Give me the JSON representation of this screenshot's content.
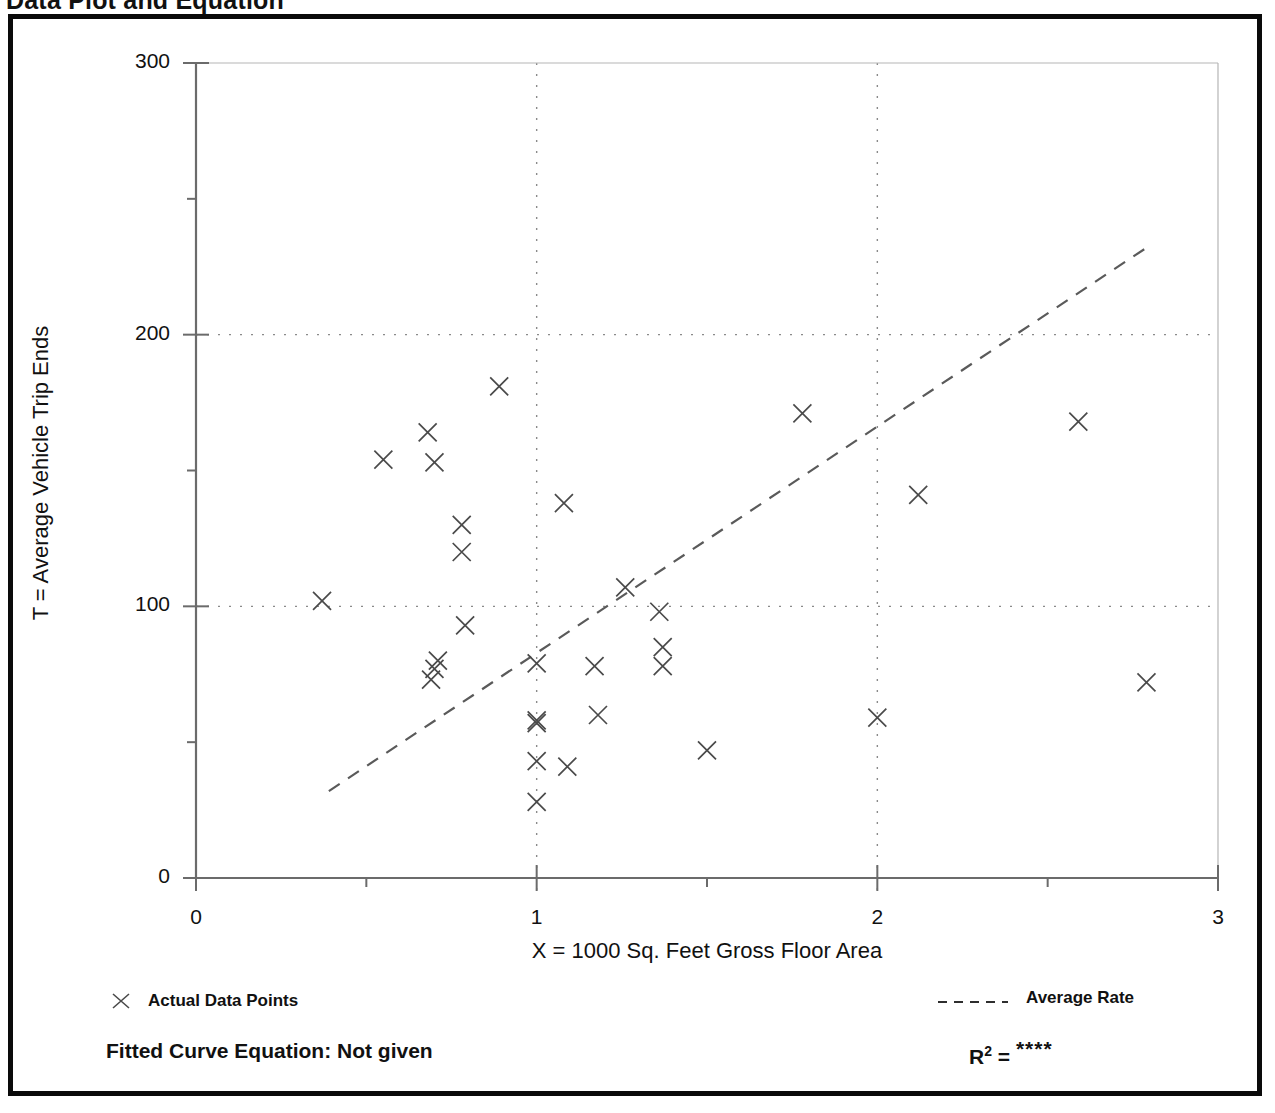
{
  "page": {
    "title": "Data Plot and Equation"
  },
  "legend": {
    "points_label": "Actual Data Points",
    "points_marker": "x-marker-icon",
    "rate_label": "Average Rate",
    "rate_marker": "dashed-line-icon"
  },
  "footer": {
    "equation_label": "Fitted Curve Equation:  Not given",
    "r2_base": "R",
    "r2_exponent": "2",
    "r2_equals": " = ",
    "r2_value": "****"
  },
  "colors": {
    "frame": "#0a0a0a",
    "axis": "#6b6b6b",
    "marker": "#4a4a4a",
    "gridline": "#8a8a8a",
    "trend": "#5a5a5a",
    "text": "#111111",
    "background": "#ffffff"
  },
  "chart_data": {
    "type": "scatter",
    "title": "Data Plot and Equation",
    "xlabel": "X = 1000 Sq. Feet Gross Floor Area",
    "ylabel": "T = Average Vehicle Trip Ends",
    "xlim": [
      0,
      3
    ],
    "ylim": [
      0,
      300
    ],
    "xticks": [
      0,
      1,
      2,
      3
    ],
    "xtick_labels": [
      "0",
      "1",
      "2",
      "3"
    ],
    "yticks": [
      0,
      100,
      200,
      300
    ],
    "ytick_labels": [
      "0",
      "100",
      "200",
      "300"
    ],
    "y_minor_ticks": [
      50,
      150,
      250
    ],
    "x_minor_ticks": [
      0.5,
      1.5,
      2.5
    ],
    "grid": true,
    "gridlines_x": [
      1,
      2
    ],
    "gridlines_y": [
      100,
      200
    ],
    "legend_position": "below-axes",
    "series": [
      {
        "name": "Actual Data Points",
        "marker": "x",
        "points": [
          [
            0.37,
            102
          ],
          [
            0.55,
            154
          ],
          [
            0.68,
            164
          ],
          [
            0.7,
            153
          ],
          [
            0.7,
            77
          ],
          [
            0.71,
            80
          ],
          [
            0.69,
            73
          ],
          [
            0.78,
            130
          ],
          [
            0.78,
            120
          ],
          [
            0.79,
            93
          ],
          [
            0.89,
            181
          ],
          [
            1.0,
            79
          ],
          [
            1.0,
            58
          ],
          [
            1.0,
            57
          ],
          [
            1.0,
            43
          ],
          [
            1.0,
            28
          ],
          [
            1.08,
            138
          ],
          [
            1.09,
            41
          ],
          [
            1.17,
            78
          ],
          [
            1.18,
            60
          ],
          [
            1.26,
            107
          ],
          [
            1.36,
            98
          ],
          [
            1.37,
            85
          ],
          [
            1.37,
            78
          ],
          [
            1.5,
            47
          ],
          [
            1.78,
            171
          ],
          [
            2.0,
            59
          ],
          [
            2.12,
            141
          ],
          [
            2.59,
            168
          ],
          [
            2.79,
            72
          ]
        ]
      }
    ],
    "trendline": {
      "name": "Average Rate",
      "style": "dashed",
      "x_start": 0.39,
      "y_start": 32,
      "x_end": 2.79,
      "y_end": 232
    }
  }
}
